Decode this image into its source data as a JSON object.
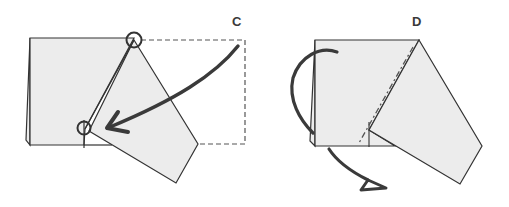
{
  "diagram": {
    "type": "origami-fold-instructions",
    "colors": {
      "paper": "#ececec",
      "outline": "#333333",
      "arrow": "#3a3a3a",
      "background": "#ffffff"
    },
    "steps": [
      {
        "label": "C",
        "description": "Fold the right flap so the top-right corner point meets the circled point on the lower left",
        "elements": [
          "paper-base",
          "folded-kite-flap",
          "dashed-original-outline",
          "reference-circle-top",
          "reference-circle-bottom",
          "fold-arrow"
        ]
      },
      {
        "label": "D",
        "description": "Fold the paper behind along the dash-dot valley line (turn under)",
        "elements": [
          "paper-base",
          "folded-kite-flap",
          "dash-dot-fold-line",
          "fold-behind-arrow"
        ]
      }
    ]
  }
}
